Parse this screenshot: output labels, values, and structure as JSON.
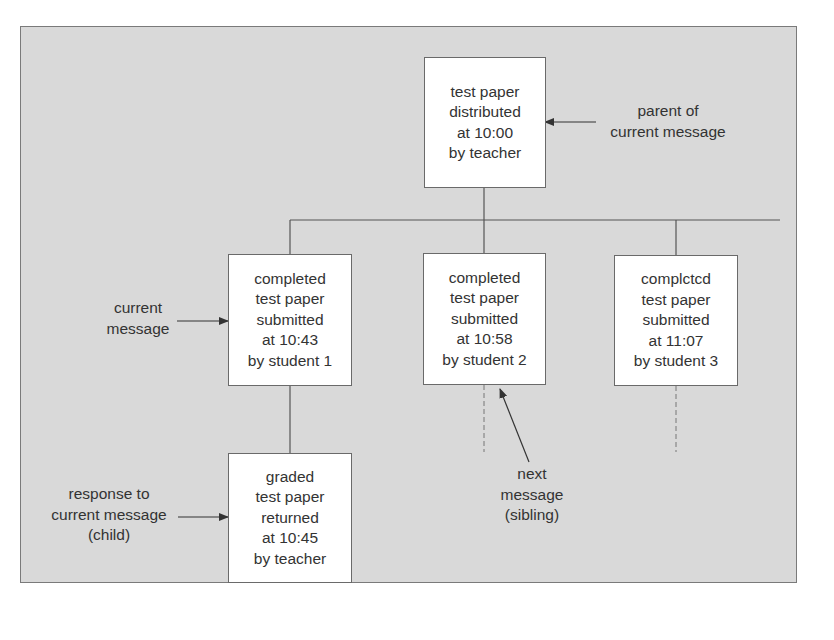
{
  "diagram": {
    "nodes": {
      "parent": {
        "lines": [
          "test paper",
          "distributed",
          "at 10:00",
          "by teacher"
        ]
      },
      "student1": {
        "lines": [
          "completed",
          "test paper",
          "submitted",
          "at 10:43",
          "by student 1"
        ]
      },
      "student2": {
        "lines": [
          "completed",
          "test paper",
          "submitted",
          "at 10:58",
          "by student 2"
        ]
      },
      "student3": {
        "lines": [
          "complctcd",
          "test paper",
          "submitted",
          "at 11:07",
          "by student 3"
        ]
      },
      "child": {
        "lines": [
          "graded",
          "test paper",
          "returned",
          "at 10:45",
          "by teacher"
        ]
      }
    },
    "annotations": {
      "parent_label": [
        "parent of",
        "current message"
      ],
      "current_label": [
        "current",
        "message"
      ],
      "child_label": [
        "response to",
        "current message",
        "(child)"
      ],
      "sibling_label": [
        "next",
        "message",
        "(sibling)"
      ]
    },
    "colors": {
      "background": "#d9d9d9",
      "box_fill": "#ffffff",
      "line": "#555555"
    }
  }
}
